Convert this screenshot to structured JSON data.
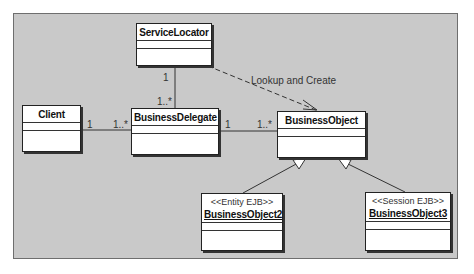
{
  "diagram": {
    "classes": {
      "service_locator": {
        "name": "ServiceLocator"
      },
      "client": {
        "name": "Client"
      },
      "business_delegate": {
        "name": "BusinessDelegate"
      },
      "business_object": {
        "name": "BusinessObject"
      },
      "business_object2": {
        "name": "BusinessObject2",
        "stereotype": "<<Entity EJB>>"
      },
      "business_object3": {
        "name": "BusinessObject3",
        "stereotype": "<<Session EJB>>"
      }
    },
    "associations": {
      "locator_delegate": {
        "end_locator": "1",
        "end_delegate": "1..*"
      },
      "client_delegate": {
        "end_client": "1",
        "end_delegate": "1..*"
      },
      "delegate_object": {
        "end_delegate": "1",
        "end_object": "1..*"
      }
    },
    "dependency_label": "Lookup and Create",
    "colors": {
      "background": "#c9c9c9",
      "box": "#ffffff",
      "line": "#333333"
    }
  }
}
